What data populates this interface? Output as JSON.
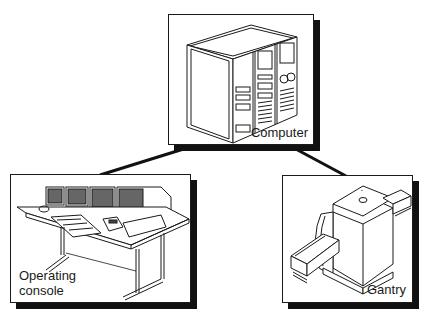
{
  "diagram": {
    "type": "hierarchy",
    "nodes": [
      {
        "id": "computer",
        "label": "Computer",
        "illustration": "computer-cabinet-icon"
      },
      {
        "id": "console",
        "label": "Operating\nconsole",
        "illustration": "operating-console-icon"
      },
      {
        "id": "gantry",
        "label": "Gantry",
        "illustration": "ct-gantry-icon"
      }
    ],
    "edges": [
      {
        "from": "computer",
        "to": "console"
      },
      {
        "from": "computer",
        "to": "gantry"
      }
    ],
    "colors": {
      "line": "#111111",
      "shadow": "#111111",
      "background": "#ffffff"
    }
  }
}
